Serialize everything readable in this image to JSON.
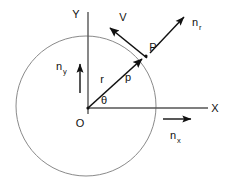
{
  "figure": {
    "background_color": "#ffffff",
    "width": 234,
    "height": 182
  },
  "colors": {
    "ink": "#111111",
    "axis": "#555555",
    "circle": "#8a8a8a",
    "background": "#ffffff"
  },
  "geometry": {
    "origin": {
      "x": 88,
      "y": 108,
      "label": "O"
    },
    "circle": {
      "cx": 86,
      "cy": 106,
      "r": 70
    },
    "point_p": {
      "x": 146,
      "y": 55,
      "label": "P"
    },
    "x_axis": {
      "x1": 88,
      "y1": 108,
      "x2": 208,
      "y2": 108
    },
    "y_axis": {
      "x1": 88,
      "y1": 12,
      "x2": 88,
      "y2": 114
    }
  },
  "labels": {
    "origin": "O",
    "x_axis": "X",
    "y_axis": "Y",
    "point": "P",
    "radius": "r",
    "angle": "θ",
    "position": "p",
    "velocity": "V"
  },
  "normals": [
    {
      "id": "n-r",
      "base": "n",
      "subscript": "r",
      "description": "radial unit normal at P",
      "arrow": {
        "x1": 150,
        "y1": 53,
        "x2": 187,
        "y2": 14
      },
      "label_x": 192,
      "label_y": 26
    },
    {
      "id": "n-y",
      "base": "n",
      "subscript": "y",
      "description": "unit normal along Y",
      "arrow": {
        "x1": 80,
        "y1": 93,
        "x2": 80,
        "y2": 61
      },
      "label_x": 59,
      "label_y": 70
    },
    {
      "id": "n-x",
      "base": "n",
      "subscript": "x",
      "description": "unit normal along X",
      "arrow": {
        "x1": 163,
        "y1": 119,
        "x2": 194,
        "y2": 119
      },
      "label_x": 172,
      "label_y": 137
    }
  ],
  "vectors": {
    "radius": {
      "label": "r",
      "secondary_label": "p",
      "from": {
        "x": 88,
        "y": 108
      },
      "to": {
        "x": 145,
        "y": 56
      },
      "label_x": 102,
      "label_y": 83,
      "secondary_label_x": 128,
      "secondary_label_y": 81
    },
    "velocity": {
      "label": "V",
      "from": {
        "x": 146,
        "y": 57
      },
      "to": {
        "x": 107,
        "y": 25
      },
      "label_x": 123,
      "label_y": 20
    }
  },
  "angle_marker": {
    "label": "θ",
    "label_x": 104,
    "label_y": 103
  }
}
